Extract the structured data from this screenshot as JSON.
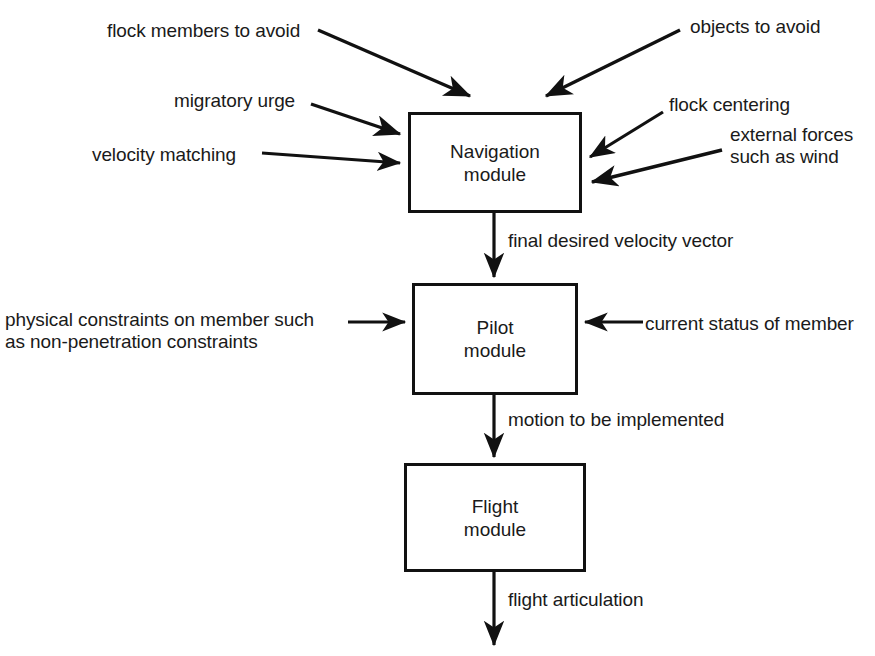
{
  "diagram": {
    "type": "flowchart",
    "canvas": {
      "width": 875,
      "height": 656
    },
    "colors": {
      "background": "#ffffff",
      "stroke": "#111111",
      "text": "#1a1a1a"
    },
    "modules": [
      {
        "id": "navigation",
        "line1": "Navigation",
        "line2": "module",
        "box": {
          "x": 408,
          "y": 112,
          "width": 174,
          "height": 101
        }
      },
      {
        "id": "pilot",
        "line1": "Pilot",
        "line2": "module",
        "box": {
          "x": 412,
          "y": 283,
          "width": 166,
          "height": 112
        }
      },
      {
        "id": "flight",
        "line1": "Flight",
        "line2": "module",
        "box": {
          "x": 404,
          "y": 463,
          "width": 182,
          "height": 109
        }
      }
    ],
    "input_labels": [
      {
        "id": "flock-members-to-avoid",
        "text": "flock members to avoid",
        "x": 107,
        "y": 20,
        "align": "left"
      },
      {
        "id": "objects-to-avoid",
        "text": "objects to avoid",
        "x": 690,
        "y": 16,
        "align": "left"
      },
      {
        "id": "migratory-urge",
        "text": "migratory urge",
        "x": 174,
        "y": 90,
        "align": "left"
      },
      {
        "id": "flock-centering",
        "text": "flock centering",
        "x": 669,
        "y": 94,
        "align": "left"
      },
      {
        "id": "velocity-matching",
        "text": "velocity matching",
        "x": 92,
        "y": 144,
        "align": "left"
      },
      {
        "id": "external-forces-line1",
        "text": "external forces",
        "x": 730,
        "y": 124,
        "align": "left"
      },
      {
        "id": "external-forces-line2",
        "text": "such as wind",
        "x": 730,
        "y": 146,
        "align": "left"
      },
      {
        "id": "physical-constraints-line1",
        "text": "physical constraints on member such",
        "x": 5,
        "y": 309,
        "align": "left"
      },
      {
        "id": "physical-constraints-line2",
        "text": "as non-penetration constraints",
        "x": 5,
        "y": 331,
        "align": "left"
      },
      {
        "id": "current-status-of-member",
        "text": "current status of member",
        "x": 645,
        "y": 313,
        "align": "left"
      }
    ],
    "flow_labels": [
      {
        "id": "final-desired-velocity-vector",
        "text": "final desired velocity vector",
        "x": 508,
        "y": 230
      },
      {
        "id": "motion-to-be-implemented",
        "text": "motion to be implemented",
        "x": 508,
        "y": 409
      },
      {
        "id": "flight-articulation",
        "text": "flight articulation",
        "x": 508,
        "y": 589
      }
    ],
    "connections": [
      {
        "id": "flock-members-to-avoid-arrow",
        "from": "flock members to avoid",
        "to": "Navigation module"
      },
      {
        "id": "objects-to-avoid-arrow",
        "from": "objects to avoid",
        "to": "Navigation module"
      },
      {
        "id": "migratory-urge-arrow",
        "from": "migratory urge",
        "to": "Navigation module"
      },
      {
        "id": "velocity-matching-arrow",
        "from": "velocity matching",
        "to": "Navigation module"
      },
      {
        "id": "flock-centering-arrow",
        "from": "flock centering",
        "to": "Navigation module"
      },
      {
        "id": "external-forces-arrow",
        "from": "external forces such as wind",
        "to": "Navigation module"
      },
      {
        "id": "navigation-to-pilot-arrow",
        "from": "Navigation module",
        "to": "Pilot module",
        "label": "final desired velocity vector"
      },
      {
        "id": "physical-constraints-arrow",
        "from": "physical constraints on member such as non-penetration constraints",
        "to": "Pilot module"
      },
      {
        "id": "current-status-arrow",
        "from": "current status of member",
        "to": "Pilot module"
      },
      {
        "id": "pilot-to-flight-arrow",
        "from": "Pilot module",
        "to": "Flight module",
        "label": "motion to be implemented"
      },
      {
        "id": "flight-output-arrow",
        "from": "Flight module",
        "to": "output",
        "label": "flight articulation"
      }
    ]
  }
}
